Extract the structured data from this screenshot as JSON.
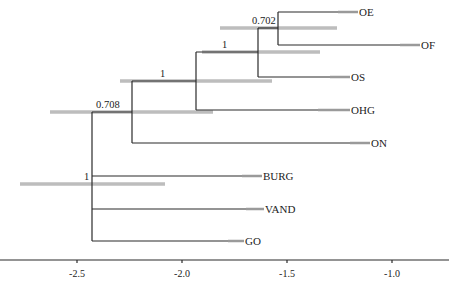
{
  "diagram": {
    "type": "phylogenetic-tree",
    "axis": {
      "ticks": [
        {
          "label": "-2.5",
          "x": 77
        },
        {
          "label": "-2.0",
          "x": 182
        },
        {
          "label": "-1.5",
          "x": 287
        },
        {
          "label": "-1.0",
          "x": 392
        }
      ]
    },
    "support_values": [
      {
        "id": "node-oe-of",
        "label": "0.702"
      },
      {
        "id": "node-oe-of-os",
        "label": "1"
      },
      {
        "id": "node-ohg",
        "label": "1"
      },
      {
        "id": "node-on",
        "label": "0.708"
      },
      {
        "id": "root",
        "label": "1"
      }
    ],
    "taxa": [
      {
        "id": "OE",
        "label": "OE"
      },
      {
        "id": "OF",
        "label": "OF"
      },
      {
        "id": "OS",
        "label": "OS"
      },
      {
        "id": "OHG",
        "label": "OHG"
      },
      {
        "id": "ON",
        "label": "ON"
      },
      {
        "id": "BURG",
        "label": "BURG"
      },
      {
        "id": "VAND",
        "label": "VAND"
      },
      {
        "id": "GO",
        "label": "GO"
      }
    ],
    "colors": {
      "branch": "#2a2a2a",
      "hpd_bar": "#bdbdbd"
    }
  }
}
